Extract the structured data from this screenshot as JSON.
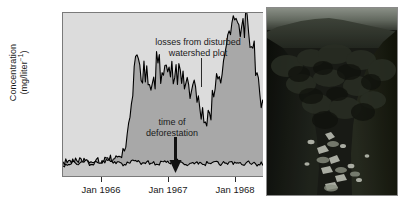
{
  "figure": {
    "y_axis": {
      "label_line1": "Concentration",
      "label_line2_pre": "(mg/liter",
      "label_line2_sup": "−1",
      "label_line2_post": ")",
      "ticks": [
        "0",
        "1",
        "3",
        "5",
        "7",
        "9",
        "11"
      ]
    },
    "x_axis": {
      "ticks": [
        "Jan 1966",
        "Jan 1967",
        "Jan 1968"
      ]
    },
    "annotations": {
      "disturbed_line1": "losses from disturbed",
      "disturbed_line2": "watershed plot",
      "deforestation_line1": "time of",
      "deforestation_line2": "deforestation",
      "arrow_icon": "down-arrow-icon",
      "leader_icon": "leader-line-icon"
    },
    "photo": {
      "caption": "",
      "alt_name": "forested-watershed-photograph"
    },
    "colors": {
      "plot_background": "#dcdcdc",
      "fill_disturbed": "#a8a8a8",
      "fill_control": "#c6c6c6",
      "line": "#000000",
      "axis": "#2b2b2b",
      "photo_dark": "#1b1d18"
    }
  },
  "chart_data": {
    "type": "area",
    "title": "",
    "subtitle": "",
    "xlabel": "",
    "ylabel": "Concentration (mg/liter−1)",
    "ylim": [
      0,
      12.2
    ],
    "yticks": [
      0,
      1,
      3,
      5,
      7,
      9,
      11
    ],
    "xlim": [
      "1965-06",
      "1968-06"
    ],
    "xticks": [
      "Jan 1966",
      "Jan 1967",
      "Jan 1968"
    ],
    "grid": false,
    "legend": "none",
    "annotations": [
      {
        "text": "losses from disturbed watershed plot",
        "points_to_x": "1966-05",
        "points_to_y": 9.0
      },
      {
        "text": "time of deforestation",
        "points_to_x": "1965-12",
        "points_to_y": 1.2
      }
    ],
    "series": [
      {
        "name": "disturbed watershed plot",
        "x": [
          "1965-06",
          "1965-07",
          "1965-08",
          "1965-09",
          "1965-10",
          "1965-11",
          "1965-12",
          "1966-01",
          "1966-02",
          "1966-03",
          "1966-04",
          "1966-05",
          "1966-06",
          "1966-07",
          "1966-08",
          "1966-09",
          "1966-10",
          "1966-11",
          "1966-12",
          "1967-01",
          "1967-02",
          "1967-03",
          "1967-04",
          "1967-05",
          "1967-06",
          "1967-07",
          "1967-08",
          "1967-09",
          "1967-10",
          "1967-11",
          "1967-12",
          "1968-01",
          "1968-02",
          "1968-03",
          "1968-04",
          "1968-05",
          "1968-06"
        ],
        "values": [
          1.2,
          1.3,
          1.1,
          1.5,
          1.3,
          1.2,
          1.4,
          1.3,
          1.5,
          1.4,
          1.6,
          2.0,
          4.5,
          9.0,
          7.2,
          8.3,
          7.0,
          8.5,
          7.6,
          8.2,
          7.4,
          8.0,
          7.0,
          6.4,
          5.6,
          5.2,
          5.0,
          6.0,
          7.5,
          9.2,
          10.6,
          11.8,
          11.2,
          12.0,
          9.6,
          7.4,
          5.4
        ]
      },
      {
        "name": "undisturbed control watershed",
        "x": [
          "1965-06",
          "1965-07",
          "1965-08",
          "1965-09",
          "1965-10",
          "1965-11",
          "1965-12",
          "1966-01",
          "1966-02",
          "1966-03",
          "1966-04",
          "1966-05",
          "1966-06",
          "1966-07",
          "1966-08",
          "1966-09",
          "1966-10",
          "1966-11",
          "1966-12",
          "1967-01",
          "1967-02",
          "1967-03",
          "1967-04",
          "1967-05",
          "1967-06",
          "1967-07",
          "1967-08",
          "1967-09",
          "1967-10",
          "1967-11",
          "1967-12",
          "1968-01",
          "1968-02",
          "1968-03",
          "1968-04",
          "1968-05",
          "1968-06"
        ],
        "values": [
          0.9,
          1.0,
          1.2,
          1.1,
          1.3,
          1.0,
          1.2,
          1.1,
          1.3,
          1.1,
          1.2,
          1.0,
          1.1,
          1.3,
          1.0,
          1.2,
          1.1,
          1.0,
          1.2,
          1.1,
          1.3,
          1.2,
          1.0,
          1.1,
          1.2,
          1.0,
          1.1,
          1.2,
          1.0,
          1.1,
          1.2,
          1.1,
          1.0,
          1.2,
          1.1,
          1.0,
          1.1
        ]
      }
    ]
  }
}
